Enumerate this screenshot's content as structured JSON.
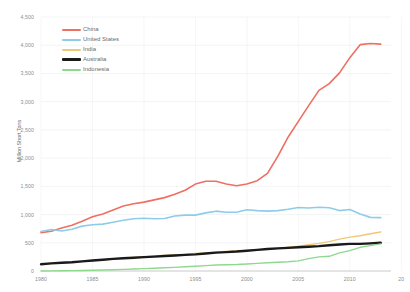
{
  "chart_data": {
    "type": "line",
    "title": "",
    "xlabel": "",
    "ylabel": "Million Short Tons",
    "xlim": [
      1980,
      2014
    ],
    "ylim": [
      0,
      4500
    ],
    "grid": true,
    "legend_position": "top-left",
    "ytick_labels": [
      "0",
      "500",
      "1,000",
      "1,500",
      "2,000",
      "2,500",
      "3,000",
      "3,500",
      "4,000",
      "4,500"
    ],
    "ytick_values": [
      0,
      500,
      1000,
      1500,
      2000,
      2500,
      3000,
      3500,
      4000,
      4500
    ],
    "xtick_labels": [
      "1980",
      "1985",
      "1990",
      "1995",
      "2000",
      "2005",
      "2010",
      "20"
    ],
    "xtick_values": [
      1980,
      1985,
      1990,
      1995,
      2000,
      2005,
      2010,
      2015
    ],
    "x": [
      1980,
      1981,
      1982,
      1983,
      1984,
      1985,
      1986,
      1987,
      1988,
      1989,
      1990,
      1991,
      1992,
      1993,
      1994,
      1995,
      1996,
      1997,
      1998,
      1999,
      2000,
      2001,
      2002,
      2003,
      2004,
      2005,
      2006,
      2007,
      2008,
      2009,
      2010,
      2011,
      2012,
      2013
    ],
    "series": [
      {
        "name": "China",
        "color": "#ef6f63",
        "width": 1.6,
        "values": [
          680,
          705,
          760,
          810,
          880,
          960,
          1010,
          1080,
          1150,
          1190,
          1220,
          1260,
          1300,
          1360,
          1430,
          1540,
          1590,
          1590,
          1540,
          1510,
          1540,
          1600,
          1730,
          2030,
          2370,
          2650,
          2930,
          3200,
          3320,
          3510,
          3780,
          4010,
          4030,
          4020
        ]
      },
      {
        "name": "United States",
        "color": "#8ecdea",
        "width": 1.6,
        "values": [
          700,
          735,
          710,
          740,
          795,
          820,
          830,
          865,
          900,
          925,
          935,
          925,
          930,
          975,
          990,
          990,
          1030,
          1060,
          1040,
          1040,
          1085,
          1070,
          1060,
          1070,
          1095,
          1125,
          1115,
          1130,
          1120,
          1070,
          1090,
          1010,
          950,
          945
        ]
      },
      {
        "name": "India",
        "color": "#f0c878",
        "width": 1.4,
        "values": [
          125,
          135,
          145,
          155,
          170,
          180,
          195,
          210,
          225,
          240,
          250,
          265,
          275,
          285,
          295,
          310,
          320,
          335,
          345,
          355,
          365,
          375,
          385,
          400,
          420,
          440,
          465,
          490,
          520,
          565,
          600,
          625,
          660,
          690
        ]
      },
      {
        "name": "Australia",
        "color": "#1a1a1a",
        "width": 2.4,
        "values": [
          120,
          135,
          145,
          155,
          170,
          185,
          200,
          215,
          225,
          235,
          245,
          255,
          265,
          275,
          285,
          295,
          310,
          325,
          335,
          345,
          360,
          375,
          390,
          400,
          410,
          420,
          430,
          440,
          455,
          470,
          480,
          480,
          490,
          500
        ]
      },
      {
        "name": "Indonesia",
        "color": "#8fd98f",
        "width": 1.4,
        "values": [
          0,
          2,
          4,
          6,
          10,
          14,
          18,
          22,
          28,
          35,
          42,
          50,
          58,
          65,
          75,
          85,
          95,
          105,
          110,
          115,
          125,
          135,
          145,
          155,
          165,
          180,
          220,
          250,
          260,
          320,
          360,
          420,
          450,
          480
        ]
      }
    ]
  }
}
